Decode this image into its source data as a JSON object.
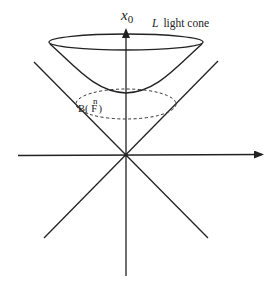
{
  "diagram": {
    "type": "light-cone-diagram",
    "axis_label_vertical": "x",
    "axis_label_vertical_subscript": "0",
    "cone_label_symbol": "L",
    "cone_label_text": "light cone",
    "region_label_main": "B( F",
    "region_label_superscript": "n",
    "region_label_close": ")",
    "colors": {
      "stroke": "#222222",
      "background": "#ffffff"
    },
    "elements": [
      "vertical-axis-arrow",
      "horizontal-axis-arrow",
      "light-cone-lines",
      "top-ellipse",
      "hyperboloid-sheet",
      "dashed-ellipse"
    ]
  }
}
